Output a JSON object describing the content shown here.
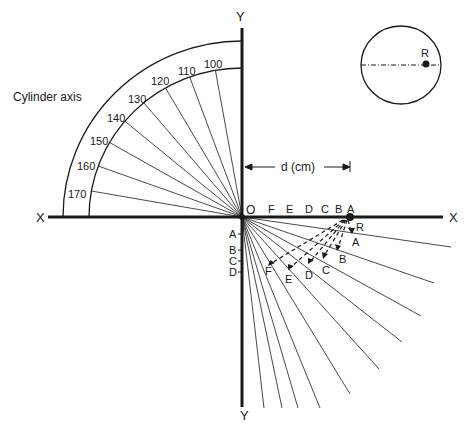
{
  "diagram": {
    "axes": {
      "x_left_label": "X",
      "x_right_label": "X",
      "y_top_label": "Y",
      "y_bottom_label": "Y",
      "origin_label": "O"
    },
    "protractor": {
      "title": "Cylinder axis",
      "ticks": [
        "100",
        "110",
        "120",
        "130",
        "140",
        "150",
        "160",
        "170"
      ]
    },
    "dimension": {
      "label": "d (cm)"
    },
    "x_axis_points": [
      "F",
      "E",
      "D",
      "C",
      "B",
      "A"
    ],
    "y_axis_points": [
      "A",
      "B",
      "C",
      "D"
    ],
    "reference_point": "R",
    "projection_points": [
      "A",
      "B",
      "C",
      "D",
      "E",
      "F"
    ],
    "inset": {
      "point_label": "R"
    },
    "colors": {
      "ink": "#1a1a1a",
      "background": "#ffffff"
    }
  }
}
